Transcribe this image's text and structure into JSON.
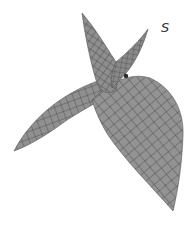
{
  "figure": {
    "label": "S",
    "colors": {
      "surface_fill": "#8c8c8c",
      "surface_fill_light": "#9a9a9a",
      "surface_fill_dark": "#7a7a7a",
      "mesh_line": "#3a3a3a",
      "background": "#ffffff",
      "label": "#333333"
    }
  }
}
